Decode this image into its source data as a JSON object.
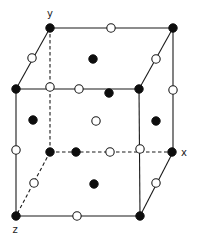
{
  "diagram": {
    "colors": {
      "line": "#1a1a1a",
      "filled_atom": "#0d0d0d",
      "open_atom_fill": "#ffffff",
      "background": "#ffffff"
    },
    "axis_labels": [
      {
        "id": "y",
        "text": "y",
        "x": 50,
        "y": 17
      },
      {
        "id": "x",
        "text": "x",
        "x": 184,
        "y": 156
      },
      {
        "id": "z",
        "text": "z",
        "x": 15,
        "y": 233
      }
    ],
    "vertices": {
      "BTL": [
        50,
        28
      ],
      "BTR": [
        173,
        28
      ],
      "FTL": [
        16,
        89
      ],
      "FTR": [
        139,
        89
      ],
      "BBL": [
        50,
        152
      ],
      "BBR": [
        173,
        152
      ],
      "FBL": [
        16,
        216
      ],
      "FBR": [
        140,
        216
      ]
    },
    "edges": [
      {
        "name": "top-back-edge",
        "from": [
          50,
          28
        ],
        "to": [
          173,
          28
        ],
        "style": "solid"
      },
      {
        "name": "top-left-edge",
        "from": [
          50,
          28
        ],
        "to": [
          16,
          89
        ],
        "style": "solid"
      },
      {
        "name": "top-right-edge",
        "from": [
          173,
          28
        ],
        "to": [
          139,
          89
        ],
        "style": "solid"
      },
      {
        "name": "top-front-edge",
        "from": [
          16,
          89
        ],
        "to": [
          139,
          89
        ],
        "style": "solid"
      },
      {
        "name": "front-left-vertical-edge",
        "from": [
          16,
          89
        ],
        "to": [
          16,
          216
        ],
        "style": "solid"
      },
      {
        "name": "front-right-vertical-edge",
        "from": [
          139,
          89
        ],
        "to": [
          140,
          216
        ],
        "style": "solid"
      },
      {
        "name": "back-right-vertical-edge",
        "from": [
          173,
          28
        ],
        "to": [
          173,
          152
        ],
        "style": "solid"
      },
      {
        "name": "bottom-front-edge",
        "from": [
          16,
          216
        ],
        "to": [
          140,
          216
        ],
        "style": "solid"
      },
      {
        "name": "bottom-right-edge",
        "from": [
          173,
          152
        ],
        "to": [
          140,
          216
        ],
        "style": "solid"
      },
      {
        "name": "back-left-vertical-edge",
        "from": [
          50,
          28
        ],
        "to": [
          50,
          152
        ],
        "style": "dashed"
      },
      {
        "name": "bottom-back-edge",
        "from": [
          50,
          152
        ],
        "to": [
          173,
          152
        ],
        "style": "dashed"
      },
      {
        "name": "bottom-left-edge",
        "from": [
          50,
          152
        ],
        "to": [
          16,
          216
        ],
        "style": "dashed"
      }
    ],
    "atoms": [
      {
        "name": "corner-back-top-left",
        "type": "filled",
        "x": 50,
        "y": 28
      },
      {
        "name": "corner-back-top-right",
        "type": "filled",
        "x": 173,
        "y": 28
      },
      {
        "name": "corner-front-top-left",
        "type": "filled",
        "x": 16,
        "y": 89
      },
      {
        "name": "corner-front-top-right",
        "type": "filled",
        "x": 139,
        "y": 89
      },
      {
        "name": "corner-back-bottom-left",
        "type": "filled",
        "x": 50,
        "y": 152
      },
      {
        "name": "corner-back-bottom-right",
        "type": "filled",
        "x": 172,
        "y": 152
      },
      {
        "name": "corner-front-bottom-left",
        "type": "filled",
        "x": 16,
        "y": 216
      },
      {
        "name": "corner-front-bottom-right",
        "type": "filled",
        "x": 140,
        "y": 216
      },
      {
        "name": "face-center-top",
        "type": "filled",
        "x": 93,
        "y": 59
      },
      {
        "name": "face-center-left",
        "type": "filled",
        "x": 33,
        "y": 120
      },
      {
        "name": "face-center-right",
        "type": "filled",
        "x": 156,
        "y": 121
      },
      {
        "name": "face-center-bottom",
        "type": "filled",
        "x": 94,
        "y": 184
      },
      {
        "name": "face-center-front",
        "type": "filled",
        "x": 109,
        "y": 93
      },
      {
        "name": "face-center-back",
        "type": "filled",
        "x": 76,
        "y": 152
      },
      {
        "name": "body-center",
        "type": "open",
        "x": 96,
        "y": 121
      },
      {
        "name": "edge-mid-top-back",
        "type": "open",
        "x": 111,
        "y": 28
      },
      {
        "name": "edge-mid-top-left",
        "type": "open",
        "x": 32,
        "y": 58
      },
      {
        "name": "edge-mid-top-right",
        "type": "open",
        "x": 156,
        "y": 59
      },
      {
        "name": "edge-mid-top-front",
        "type": "open",
        "x": 79,
        "y": 89
      },
      {
        "name": "edge-mid-front-left-vertical",
        "type": "open",
        "x": 16,
        "y": 150
      },
      {
        "name": "edge-mid-front-right-vertical",
        "type": "open",
        "x": 140,
        "y": 149
      },
      {
        "name": "edge-mid-back-right-vertical",
        "type": "open",
        "x": 173,
        "y": 90
      },
      {
        "name": "edge-mid-back-left-vertical",
        "type": "open",
        "x": 50,
        "y": 87
      },
      {
        "name": "edge-mid-bottom-back",
        "type": "open",
        "x": 110,
        "y": 152
      },
      {
        "name": "edge-mid-bottom-left",
        "type": "open",
        "x": 34,
        "y": 183
      },
      {
        "name": "edge-mid-bottom-right",
        "type": "open",
        "x": 156,
        "y": 183
      },
      {
        "name": "edge-mid-bottom-front",
        "type": "open",
        "x": 77,
        "y": 216
      }
    ],
    "atom_radius": {
      "filled": 4.2,
      "open": 4.2
    }
  }
}
